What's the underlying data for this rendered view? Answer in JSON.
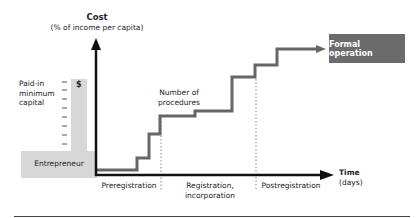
{
  "diagram": {
    "y_axis": {
      "title": "Cost",
      "subtitle": "(% of income per capita)"
    },
    "x_axis": {
      "title": "Time",
      "subtitle": "(days)"
    },
    "left_panel": {
      "capital_label_lines": [
        "Paid-in",
        "minimum",
        "capital"
      ],
      "currency_symbol": "$",
      "actor_label": "Entrepreneur"
    },
    "curve_label_lines": [
      "Number of",
      "procedures"
    ],
    "end_box_label": "Formal operation",
    "phases": [
      {
        "label_lines": [
          "Preregistration"
        ]
      },
      {
        "label_lines": [
          "Registration,",
          "incorporation"
        ]
      },
      {
        "label_lines": [
          "Postregistration"
        ]
      }
    ],
    "colors": {
      "axis": "#111111",
      "curve": "#666666",
      "end_box": "#6b6b6b",
      "panel": "#d7d7d7",
      "divider": "#888888"
    }
  }
}
